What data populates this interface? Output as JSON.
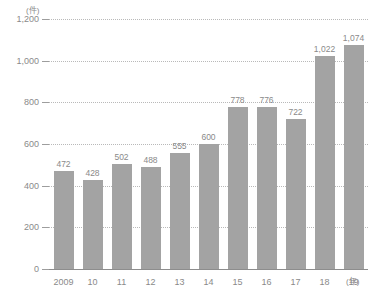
{
  "chart_data": {
    "type": "bar",
    "title": "",
    "subtitle": "",
    "xlabel": "(年)",
    "ylabel": "(件)",
    "categories": [
      "2009",
      "10",
      "11",
      "12",
      "13",
      "14",
      "15",
      "16",
      "17",
      "18",
      "19"
    ],
    "values": [
      472,
      428,
      502,
      488,
      555,
      600,
      778,
      776,
      722,
      1022,
      1074
    ],
    "value_labels": [
      "472",
      "428",
      "502",
      "488",
      "555",
      "600",
      "778",
      "776",
      "722",
      "1,022",
      "1,074"
    ],
    "ylim": [
      0,
      1200
    ],
    "yticks": [
      0,
      200,
      400,
      600,
      800,
      1000,
      1200
    ],
    "ytick_labels": [
      "0",
      "200",
      "400",
      "600",
      "800",
      "1,000",
      "1,200"
    ],
    "grid": true,
    "grid_style": "dotted",
    "legend": "none",
    "series": [
      {
        "name": "件数",
        "values": [
          472,
          428,
          502,
          488,
          555,
          600,
          778,
          776,
          722,
          1022,
          1074
        ]
      }
    ],
    "colors": {
      "bar": "#a3a3a3",
      "gridline": "#b9b9b9",
      "axis": "#8d8d8d",
      "text": "#8a8a8a",
      "background": "#ffffff"
    }
  }
}
